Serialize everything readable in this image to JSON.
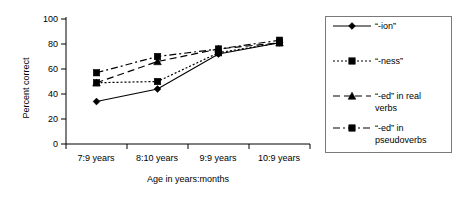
{
  "chart_data": {
    "type": "line",
    "title": "",
    "xlabel": "Age in years:months",
    "ylabel": "Percent correct",
    "categories": [
      "7:9 years",
      "8:10 years",
      "9:9 years",
      "10:9 years"
    ],
    "ylim": [
      0,
      100
    ],
    "yticks": [
      "0",
      "20",
      "40",
      "60",
      "80",
      "100"
    ],
    "grid": false,
    "legend_position": "right",
    "series": [
      {
        "name": "“-ion”",
        "values": [
          34,
          44,
          72,
          81
        ],
        "marker": "diamond",
        "dash": "solid"
      },
      {
        "name": "“-ness”",
        "values": [
          49,
          50,
          73,
          81
        ],
        "marker": "square",
        "dash": "dotted"
      },
      {
        "name": "“-ed” in real verbs",
        "values": [
          49,
          66,
          76,
          81
        ],
        "marker": "triangle",
        "dash": "dashed"
      },
      {
        "name": "“-ed” in pseudoverbs",
        "values": [
          57,
          70,
          76,
          83
        ],
        "marker": "square",
        "dash": "dash-dot"
      }
    ]
  },
  "legend": {
    "entries": [
      {
        "label": "“-ion”",
        "line2": ""
      },
      {
        "label": "“-ness”",
        "line2": ""
      },
      {
        "label": "“-ed” in real",
        "line2": "verbs"
      },
      {
        "label": "“-ed” in",
        "line2": "pseudoverbs"
      }
    ]
  },
  "axes": {
    "y_label": "Percent correct",
    "x_label": "Age in years:months",
    "y_ticks": [
      "100",
      "80",
      "60",
      "40",
      "20",
      "0"
    ],
    "x_ticks": [
      "7:9 years",
      "8:10 years",
      "9:9 years",
      "10:9 years"
    ]
  },
  "colors": {
    "ink": "#000000",
    "legend_border": "#7a7a7a",
    "background": "#ffffff"
  }
}
